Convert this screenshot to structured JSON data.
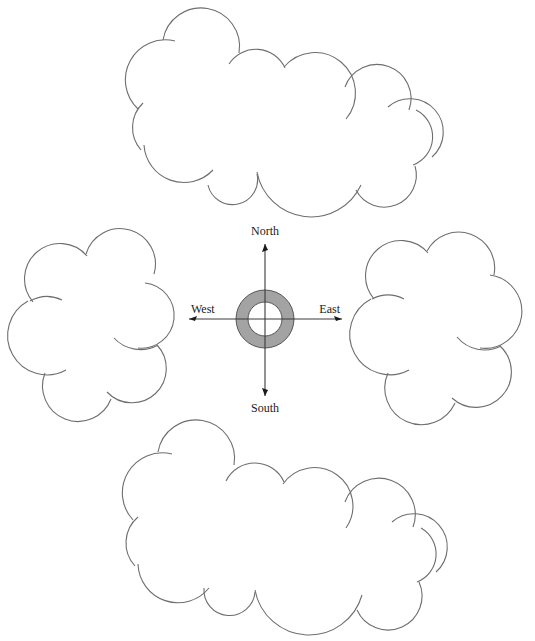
{
  "diagram": {
    "type": "compass-with-clouds",
    "compass": {
      "center": [
        265,
        319
      ],
      "ring_outer_radius": 29,
      "ring_inner_radius": 17,
      "ring_color": "#a3a3a3",
      "labels": {
        "north": "North",
        "south": "South",
        "east": "East",
        "west": "West"
      }
    },
    "clouds": [
      {
        "id": "top",
        "position": "north"
      },
      {
        "id": "left",
        "position": "west"
      },
      {
        "id": "right",
        "position": "east"
      },
      {
        "id": "bottom",
        "position": "south"
      }
    ],
    "colors": {
      "outline": "#6e6e6e",
      "background": "#ffffff"
    }
  }
}
